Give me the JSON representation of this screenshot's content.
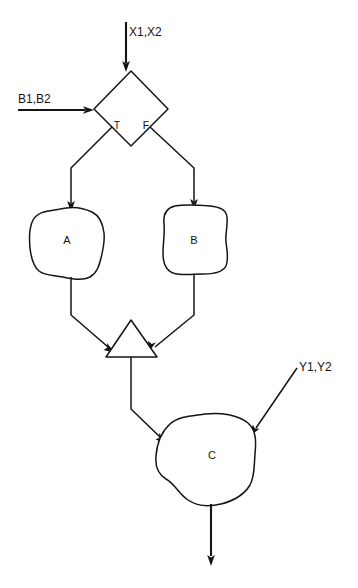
{
  "diagram": {
    "type": "flowchart",
    "background_color": "#ffffff",
    "stroke_color": "#141414",
    "inputs": [
      {
        "id": "input-x",
        "label": "X1,X2",
        "direction": "down",
        "target": "decision"
      },
      {
        "id": "input-b",
        "label": "B1,B2",
        "direction": "right",
        "target": "decision"
      },
      {
        "id": "input-y",
        "label": "Y1,Y2",
        "direction": "down-left",
        "target": "process-c"
      }
    ],
    "nodes": [
      {
        "id": "decision",
        "shape": "diamond",
        "label": ""
      },
      {
        "id": "process-a",
        "shape": "blob",
        "label": "A"
      },
      {
        "id": "process-b",
        "shape": "blob",
        "label": "B"
      },
      {
        "id": "merge",
        "shape": "triangle",
        "label": ""
      },
      {
        "id": "process-c",
        "shape": "blob",
        "label": "C"
      }
    ],
    "branch_labels": {
      "true": "T",
      "false": "F"
    },
    "edges": [
      {
        "from": "input-x",
        "to": "decision"
      },
      {
        "from": "input-b",
        "to": "decision"
      },
      {
        "from": "decision",
        "to": "process-a",
        "label": "T"
      },
      {
        "from": "decision",
        "to": "process-b",
        "label": "F"
      },
      {
        "from": "process-a",
        "to": "merge"
      },
      {
        "from": "process-b",
        "to": "merge"
      },
      {
        "from": "merge",
        "to": "process-c"
      },
      {
        "from": "input-y",
        "to": "process-c"
      },
      {
        "from": "process-c",
        "to": "output"
      }
    ],
    "output": {
      "id": "output",
      "label": "",
      "direction": "down"
    }
  }
}
